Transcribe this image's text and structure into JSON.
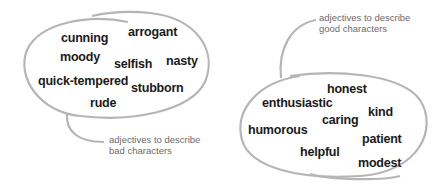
{
  "bad_group": {
    "label": "adjectives to describe\nbad characters",
    "words": [
      "cunning",
      "arrogant",
      "moody",
      "selfish",
      "nasty",
      "quick-tempered",
      "stubborn",
      "rude"
    ]
  },
  "good_group": {
    "label": "adjectives to describe\ngood characters",
    "words": [
      "honest",
      "enthusiastic",
      "kind",
      "caring",
      "humorous",
      "patient",
      "helpful",
      "modest"
    ]
  },
  "colors": {
    "outline": "#b5b5b5",
    "word_text": "#1a1a1a",
    "label_text": "#6b6b6b"
  }
}
